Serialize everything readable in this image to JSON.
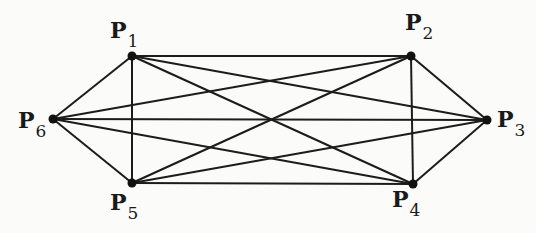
{
  "diagram": {
    "type": "complete-graph",
    "name": "K6",
    "colors": {
      "edge": "#1c1c1c",
      "node": "#111111",
      "background": "#fbfbfa"
    },
    "nodes": [
      {
        "id": "P1",
        "letter": "P",
        "sub": "1",
        "x": 132,
        "y": 56,
        "lx": 110,
        "ly": 38
      },
      {
        "id": "P2",
        "letter": "P",
        "sub": "2",
        "x": 411,
        "y": 56,
        "lx": 405,
        "ly": 30
      },
      {
        "id": "P3",
        "letter": "P",
        "sub": "3",
        "x": 487,
        "y": 120,
        "lx": 497,
        "ly": 127
      },
      {
        "id": "P4",
        "letter": "P",
        "sub": "4",
        "x": 413,
        "y": 184,
        "lx": 392,
        "ly": 207
      },
      {
        "id": "P5",
        "letter": "P",
        "sub": "5",
        "x": 132,
        "y": 183,
        "lx": 110,
        "ly": 210
      },
      {
        "id": "P6",
        "letter": "P",
        "sub": "6",
        "x": 53,
        "y": 119,
        "lx": 18,
        "ly": 128
      }
    ],
    "edges": [
      [
        "P1",
        "P2"
      ],
      [
        "P1",
        "P3"
      ],
      [
        "P1",
        "P4"
      ],
      [
        "P1",
        "P5"
      ],
      [
        "P1",
        "P6"
      ],
      [
        "P2",
        "P3"
      ],
      [
        "P2",
        "P4"
      ],
      [
        "P2",
        "P5"
      ],
      [
        "P2",
        "P6"
      ],
      [
        "P3",
        "P4"
      ],
      [
        "P3",
        "P5"
      ],
      [
        "P3",
        "P6"
      ],
      [
        "P4",
        "P5"
      ],
      [
        "P4",
        "P6"
      ],
      [
        "P5",
        "P6"
      ]
    ]
  }
}
